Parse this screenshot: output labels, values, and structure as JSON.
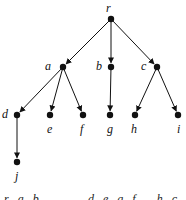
{
  "diagram": {
    "type": "rooted-tree",
    "edge_color": "#111111",
    "node_color": "#111111",
    "nodes": [
      {
        "id": "r",
        "label": "r",
        "x": 111,
        "y": 19,
        "label_x": 106,
        "label_y": 2
      },
      {
        "id": "a",
        "label": "a",
        "x": 63,
        "y": 67,
        "label_x": 45,
        "label_y": 60
      },
      {
        "id": "b",
        "label": "b",
        "x": 111,
        "y": 67,
        "label_x": 96,
        "label_y": 60
      },
      {
        "id": "c",
        "label": "c",
        "x": 157,
        "y": 67,
        "label_x": 141,
        "label_y": 60
      },
      {
        "id": "d",
        "label": "d",
        "x": 17,
        "y": 115,
        "label_x": 2,
        "label_y": 108
      },
      {
        "id": "e",
        "label": "e",
        "x": 50,
        "y": 115,
        "label_x": 47,
        "label_y": 123
      },
      {
        "id": "f",
        "label": "f",
        "x": 83,
        "y": 115,
        "label_x": 80,
        "label_y": 123
      },
      {
        "id": "g",
        "label": "g",
        "x": 110,
        "y": 115,
        "label_x": 107,
        "label_y": 123
      },
      {
        "id": "h",
        "label": "h",
        "x": 135,
        "y": 115,
        "label_x": 131,
        "label_y": 123
      },
      {
        "id": "i",
        "label": "i",
        "x": 178,
        "y": 115,
        "label_x": 177,
        "label_y": 123
      },
      {
        "id": "j",
        "label": "j",
        "x": 17,
        "y": 162,
        "label_x": 15,
        "label_y": 170
      }
    ],
    "edges": [
      {
        "from": "r",
        "to": "a"
      },
      {
        "from": "r",
        "to": "b"
      },
      {
        "from": "r",
        "to": "c"
      },
      {
        "from": "a",
        "to": "d"
      },
      {
        "from": "a",
        "to": "e"
      },
      {
        "from": "a",
        "to": "f"
      },
      {
        "from": "b",
        "to": "g"
      },
      {
        "from": "c",
        "to": "h"
      },
      {
        "from": "c",
        "to": "i"
      },
      {
        "from": "d",
        "to": "j"
      }
    ],
    "bottom_text": {
      "left": "r a b",
      "right": "d e g f   h c i"
    }
  }
}
